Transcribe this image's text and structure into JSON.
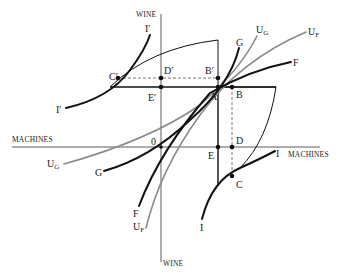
{
  "diagram": {
    "axes": {
      "top": "WINE",
      "bottom": "WINE",
      "left": "MACHINES",
      "right": "MACHINES"
    },
    "origin_label": "0",
    "points": {
      "A": "A",
      "B": "B",
      "B_prime": "B′",
      "C": "C",
      "C_prime": "C′",
      "D": "D",
      "D_prime": "D′",
      "E": "E",
      "E_prime": "E′"
    },
    "curves": {
      "I_top": "I′",
      "I_left": "I′",
      "I_right": "I",
      "I_bottom": "I",
      "G_top": "G",
      "G_bottom": "G",
      "F_top": "F",
      "F_bottom": "F",
      "UG_top_main": "U",
      "UG_top_sub": "G",
      "UF_top_main": "U",
      "UF_top_sub": "F",
      "UG_bottom_main": "U",
      "UG_bottom_sub": "G",
      "UF_bottom_main": "U",
      "UF_bottom_sub": "F"
    }
  }
}
